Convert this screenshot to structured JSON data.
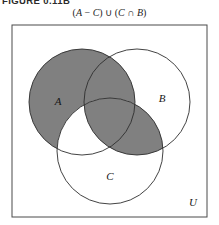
{
  "figure": {
    "number_label": "FIGURE 0.11B",
    "caption_parts": {
      "open_paren": "(",
      "set_a": "A",
      "minus": " − ",
      "set_c_1": "C",
      "close_paren": ")",
      "union": " ∪ ",
      "open_paren_2": "(",
      "set_c_2": "C",
      "intersect": " ∩ ",
      "set_b": "B",
      "close_paren_2": ")"
    },
    "caption_full": "(A − C) ∪ (C ∩ B)"
  },
  "diagram": {
    "type": "venn-3-set",
    "universe_label": "U",
    "set_labels": {
      "a": "A",
      "b": "B",
      "c": "C"
    },
    "shaded_description": "(A − C) ∪ (C ∩ B)",
    "colors": {
      "shade_fill": "#808080",
      "stroke": "#2e2e2e",
      "universe_stroke": "#4a4a4a",
      "background": "#ffffff"
    },
    "geometry": {
      "universe_rect": {
        "x": 1,
        "y": 1,
        "width": 195,
        "height": 192
      },
      "circle_a": {
        "cx": 71,
        "cy": 78,
        "r": 53
      },
      "circle_b": {
        "cx": 126,
        "cy": 78,
        "r": 53
      },
      "circle_c": {
        "cx": 99,
        "cy": 127,
        "r": 53
      }
    },
    "label_positions": {
      "a": {
        "x": 47,
        "y": 81
      },
      "b": {
        "x": 151,
        "y": 78
      },
      "c": {
        "x": 99,
        "y": 156
      },
      "u": {
        "x": 182,
        "y": 182
      }
    }
  }
}
